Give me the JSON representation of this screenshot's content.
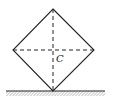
{
  "diagram": {
    "center_label": "C",
    "shape": "square-on-vertex",
    "colors": {
      "stroke": "#222222",
      "background": "#ffffff"
    }
  }
}
